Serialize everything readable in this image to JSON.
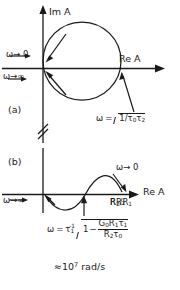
{
  "figure": {
    "type": "nyquist-plots",
    "panels": [
      {
        "id": "a",
        "panel_label": "(a)",
        "axis_imag_label": "Im A",
        "axis_real_label": "Re A",
        "annotations": [
          {
            "name": "omega-to-zero",
            "text": "ω→ 0"
          },
          {
            "name": "omega-to-infinity",
            "text": "ω→∞"
          }
        ],
        "frequency_marker": {
          "omega_symbol": "ω",
          "equals": "=",
          "expression": "1/τ₀τ₂",
          "radicand_lead": "1",
          "radicand_slash": "/",
          "radicand_tau_a": "τ",
          "radicand_tau_a_sub": "0",
          "radicand_tau_b": "τ",
          "radicand_tau_b_sub": "2"
        },
        "curve": "circle tangent to imaginary axis at origin, traversed clockwise",
        "axis_break": true
      },
      {
        "id": "b",
        "panel_label": "(b)",
        "axis_real_label": "Re A",
        "real_axis_point_label": {
          "num": "R₂",
          "slash": "/",
          "den": "R₁",
          "text": "R₂/R₁"
        },
        "annotations": [
          {
            "name": "omega-to-zero",
            "text": "ω→ 0"
          },
          {
            "name": "omega-to-infinity",
            "text": "ω→∞"
          }
        ],
        "frequency_marker": {
          "omega_symbol": "ω",
          "equals": "=",
          "tau": "τ",
          "tau_sub": "1",
          "tau_sup": "-1",
          "radicand_one": "1",
          "minus": "−",
          "fraction_numerator": "G₀R₁τ₁",
          "fraction_denominator": "R₂τ₀",
          "num_g": "G",
          "num_g_sub": "0",
          "num_r": "R",
          "num_r_sub": "1",
          "num_t": "τ",
          "num_t_sub": "1",
          "den_r": "R",
          "den_r_sub": "2",
          "den_t": "τ",
          "den_t_sub": "0"
        },
        "magnitude_note": {
          "approx": "≈",
          "mantissa": "10",
          "exponent": "7",
          "unit": "rad/s",
          "text": "≈ 10⁷ rad/s"
        },
        "curve": "S-shaped locus dipping below real axis then arcing above, ending at R2/R1"
      }
    ],
    "colors": {
      "stroke": "#1a1a1a",
      "background": "#ffffff"
    }
  }
}
